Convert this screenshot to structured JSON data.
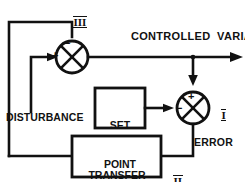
{
  "diagram": {
    "colors": {
      "ink": "#111111",
      "paper": "#ffffff"
    },
    "labels": {
      "controlled_variable": "CONTROLLED  VARIABLE",
      "disturbance": "DISTURBANCE",
      "error": "ERROR"
    },
    "blocks": [
      {
        "id": "set-point",
        "line1": "SET",
        "line2": "POINT",
        "text": "SET\nPOINT"
      },
      {
        "id": "transfer-function",
        "line1": "TRANSFER",
        "line2": "FUNCTION",
        "text": "TRANSFER\nFUNCTION"
      }
    ],
    "summing_junctions": [
      {
        "id": "process-junction",
        "marker": "III",
        "top_sign": "−",
        "left_sign": "+"
      },
      {
        "id": "comparator-junction",
        "marker": "I",
        "top_sign": "+",
        "left_sign": "−"
      }
    ],
    "markers": {
      "one": "I",
      "two": "II",
      "three": "III"
    },
    "signs": {
      "plus": "+",
      "minus": "−"
    }
  }
}
